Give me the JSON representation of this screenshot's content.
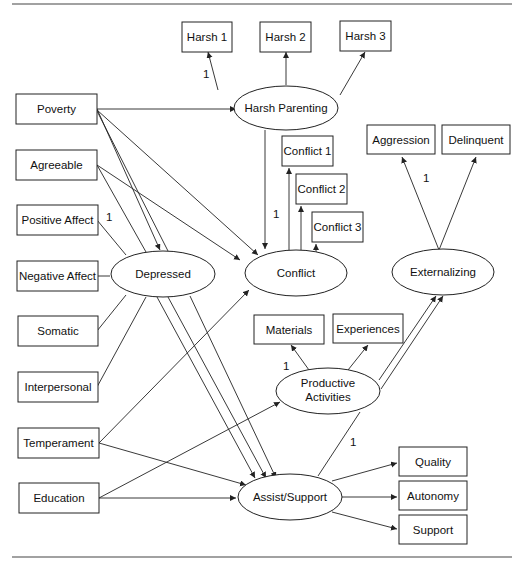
{
  "diagram": {
    "observed": {
      "harsh1": "Harsh 1",
      "harsh2": "Harsh 2",
      "harsh3": "Harsh 3",
      "poverty": "Poverty",
      "agreeable": "Agreeable",
      "positive_affect": "Positive Affect",
      "negative_affect": "Negative Affect",
      "somatic": "Somatic",
      "interpersonal": "Interpersonal",
      "temperament": "Temperament",
      "education": "Education",
      "conflict1": "Conflict 1",
      "conflict2": "Conflict 2",
      "conflict3": "Conflict 3",
      "aggression": "Aggression",
      "delinquent": "Delinquent",
      "materials": "Materials",
      "experiences": "Experiences",
      "quality": "Quality",
      "autonomy": "Autonomy",
      "support": "Support"
    },
    "latent": {
      "harsh_parenting": "Harsh Parenting",
      "depressed": "Depressed",
      "conflict": "Conflict",
      "externalizing": "Externalizing",
      "productive_activities_line1": "Productive",
      "productive_activities_line2": "Activities",
      "assist_support": "Assist/Support"
    },
    "loadings": {
      "harsh": "1",
      "positive_affect": "1",
      "conflict": "1",
      "aggression": "1",
      "materials": "1",
      "productive_assist": "1"
    }
  }
}
